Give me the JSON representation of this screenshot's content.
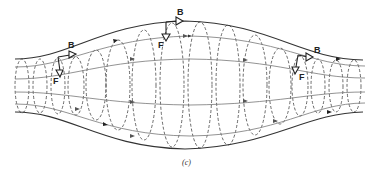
{
  "figure": {
    "caption": "(c)",
    "colors": {
      "field_line": "#777777",
      "envelope": "#333333",
      "orbit": "#444444",
      "vector": "#222222",
      "background": "#ffffff"
    }
  },
  "labels": {
    "b_left": "B",
    "b_top": "B",
    "b_right": "B",
    "f_left": "F",
    "f_top": "F",
    "f_right": "F"
  }
}
